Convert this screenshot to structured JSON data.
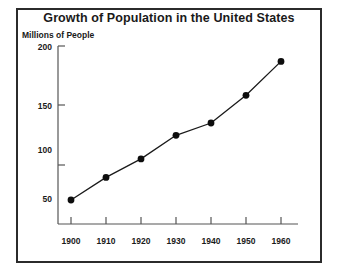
{
  "chart_data": {
    "type": "line",
    "title": "Growth of Population in the United States",
    "xlabel": "",
    "ylabel": "Millions of People",
    "x": [
      1900,
      1910,
      1920,
      1930,
      1940,
      1950,
      1960
    ],
    "categories": [
      "1900",
      "1910",
      "1920",
      "1930",
      "1940",
      "1950",
      "1960"
    ],
    "values": [
      50,
      72,
      90,
      113,
      125,
      152,
      185
    ],
    "series": [
      {
        "name": "Population",
        "values": [
          50,
          72,
          90,
          113,
          125,
          152,
          185
        ]
      }
    ],
    "xtick_labels": [
      "1900",
      "1910",
      "1920",
      "1930",
      "1940",
      "1950",
      "1960"
    ],
    "ytick_labels": [
      "50",
      "100",
      "150",
      "200"
    ],
    "ytick_values": [
      50,
      100,
      150,
      200
    ],
    "ylim": [
      25,
      200
    ],
    "xlim": [
      1895,
      1967
    ],
    "grid": false,
    "legend": false,
    "marker": "filled-circle",
    "line_color": "#1a1a1a",
    "marker_color": "#0d0d0d",
    "axis_color": "#555555",
    "background_color": "#ffffff",
    "border_color": "#2b2b2b"
  },
  "axis": {
    "y_labels": [
      "200",
      "150",
      "100",
      "50"
    ],
    "x_labels": [
      "1900",
      "1910",
      "1920",
      "1930",
      "1940",
      "1950",
      "1960"
    ],
    "y_axis_caption": "Millions of People"
  },
  "title": {
    "text": "Growth of Population in the United States"
  }
}
